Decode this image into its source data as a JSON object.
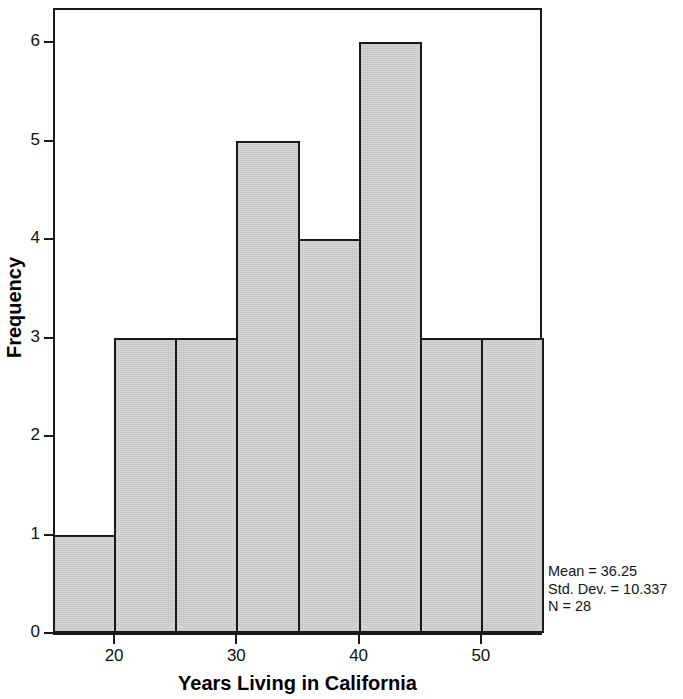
{
  "chart_data": {
    "type": "bar",
    "chart_subtype": "histogram",
    "title": "",
    "xlabel": "Years Living in California",
    "ylabel": "Frequency",
    "xlim": [
      15,
      55
    ],
    "ylim": [
      0,
      6.35
    ],
    "grid": false,
    "legend": null,
    "bin_width": 5,
    "bin_edges": [
      15,
      20,
      25,
      30,
      35,
      40,
      45,
      50,
      55
    ],
    "categories": [
      "15-20",
      "20-25",
      "25-30",
      "30-35",
      "35-40",
      "40-45",
      "45-50",
      "50-55"
    ],
    "values": [
      1,
      3,
      3,
      5,
      4,
      6,
      3,
      3
    ],
    "bars": [
      {
        "label": "15-20",
        "start": 15,
        "end": 20,
        "value": 1
      },
      {
        "label": "20-25",
        "start": 20,
        "end": 25,
        "value": 3
      },
      {
        "label": "25-30",
        "start": 25,
        "end": 30,
        "value": 3
      },
      {
        "label": "30-35",
        "start": 30,
        "end": 35,
        "value": 5
      },
      {
        "label": "35-40",
        "start": 35,
        "end": 40,
        "value": 4
      },
      {
        "label": "40-45",
        "start": 40,
        "end": 45,
        "value": 6
      },
      {
        "label": "45-50",
        "start": 45,
        "end": 50,
        "value": 3
      },
      {
        "label": "50-55",
        "start": 50,
        "end": 55,
        "value": 3
      }
    ],
    "x_ticks": [
      {
        "value": 20,
        "label": "20"
      },
      {
        "value": 30,
        "label": "30"
      },
      {
        "value": 40,
        "label": "40"
      },
      {
        "value": 50,
        "label": "50"
      }
    ],
    "y_ticks": [
      {
        "value": 0,
        "label": "0"
      },
      {
        "value": 1,
        "label": "1"
      },
      {
        "value": 2,
        "label": "2"
      },
      {
        "value": 3,
        "label": "3"
      },
      {
        "value": 4,
        "label": "4"
      },
      {
        "value": 5,
        "label": "5"
      },
      {
        "value": 6,
        "label": "6"
      }
    ],
    "annotations": {
      "mean": "Mean = 36.25",
      "std_dev": "Std. Dev. = 10.337",
      "n": "N = 28"
    },
    "colors": {
      "bar_fill": "#d6d6d6",
      "bar_edge": "#1a1a1a",
      "axis": "#1a1a1a",
      "text": "#000000",
      "background": "#ffffff"
    }
  }
}
